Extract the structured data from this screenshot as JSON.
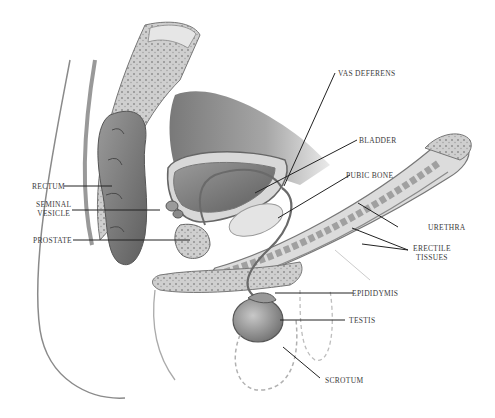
{
  "diagram": {
    "type": "anatomical-illustration",
    "labels": [
      {
        "id": "rectum",
        "text": "RECTUM"
      },
      {
        "id": "seminal_vesicle",
        "text": "SEMINAL\nVESICLE"
      },
      {
        "id": "prostate",
        "text": "PROSTATE"
      },
      {
        "id": "vas_deferens",
        "text": "VAS DEFERENS"
      },
      {
        "id": "bladder",
        "text": "BLADDER"
      },
      {
        "id": "pubic_bone",
        "text": "PUBIC BONE"
      },
      {
        "id": "urethra",
        "text": "URETHRA"
      },
      {
        "id": "erectile_tissues",
        "text": "ERECTILE\nTISSUES"
      },
      {
        "id": "epididymis",
        "text": "EPIDIDYMIS"
      },
      {
        "id": "testis",
        "text": "TESTIS"
      },
      {
        "id": "scrotum",
        "text": "SCROTUM"
      }
    ]
  }
}
